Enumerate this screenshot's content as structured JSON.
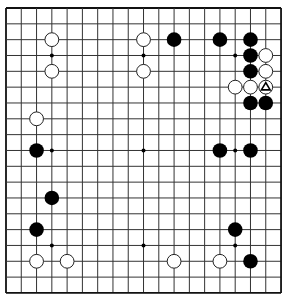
{
  "board": {
    "size": 19,
    "origin_x": 6,
    "origin_y": 8,
    "spacing_x": 15.28,
    "spacing_y": 15.83,
    "line_color": "#333333",
    "border_color": "#111111",
    "background": "#ffffff",
    "stone_radius": 7.3
  },
  "star_points": [
    [
      3,
      3
    ],
    [
      9,
      3
    ],
    [
      15,
      3
    ],
    [
      3,
      9
    ],
    [
      9,
      9
    ],
    [
      15,
      9
    ],
    [
      3,
      15
    ],
    [
      9,
      15
    ],
    [
      15,
      15
    ]
  ],
  "stones": {
    "black": [
      [
        11,
        2
      ],
      [
        14,
        2
      ],
      [
        16,
        2
      ],
      [
        16,
        3
      ],
      [
        16,
        4
      ],
      [
        16,
        6
      ],
      [
        17,
        6
      ],
      [
        2,
        9
      ],
      [
        14,
        9
      ],
      [
        16,
        9
      ],
      [
        3,
        12
      ],
      [
        2,
        14
      ],
      [
        15,
        14
      ],
      [
        16,
        16
      ]
    ],
    "white": [
      [
        3,
        2
      ],
      [
        3,
        4
      ],
      [
        9,
        2
      ],
      [
        9,
        4
      ],
      [
        17,
        3
      ],
      [
        17,
        4
      ],
      [
        15,
        5
      ],
      [
        16,
        5
      ],
      [
        17,
        5
      ],
      [
        2,
        7
      ],
      [
        2,
        16
      ],
      [
        4,
        16
      ],
      [
        11,
        16
      ],
      [
        14,
        16
      ]
    ]
  },
  "markers": [
    {
      "type": "triangle",
      "col": 17,
      "row": 5,
      "on": "white",
      "color": "#000000"
    }
  ],
  "colors": {
    "black_stone": "#000000",
    "white_stone": "#ffffff",
    "white_stone_outline": "#222222"
  }
}
